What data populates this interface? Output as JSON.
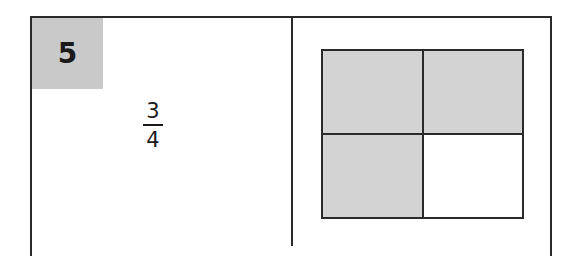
{
  "problem": {
    "number": "5",
    "fraction": {
      "numerator": "3",
      "denominator": "4"
    }
  },
  "model": {
    "rows": 2,
    "cols": 2,
    "cells": [
      {
        "shaded": true
      },
      {
        "shaded": true
      },
      {
        "shaded": true
      },
      {
        "shaded": false
      }
    ]
  },
  "colors": {
    "number_box": "#c9c9c9",
    "shaded_cell": "#d3d3d3",
    "border": "#2a2a2a"
  }
}
